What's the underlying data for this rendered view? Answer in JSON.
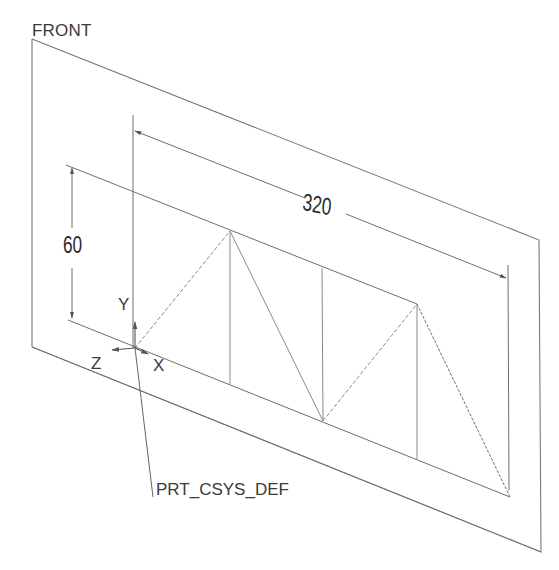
{
  "view": {
    "plane_label": "FRONT",
    "csys_label": "PRT_CSYS_DEF",
    "axes": {
      "x": "X",
      "y": "Y",
      "z": "Z"
    },
    "dimensions": {
      "length": "320",
      "height": "60"
    }
  },
  "colors": {
    "background": "#ffffff",
    "line": "#6e6e6e",
    "dashed": "#8a8a8a",
    "text": "#3a3a3a"
  },
  "geometry": {
    "plane": [
      [
        32,
        39
      ],
      [
        539,
        240
      ],
      [
        541,
        552
      ],
      [
        32,
        347
      ]
    ],
    "origin": [
      135,
      348
    ],
    "truss_top_nodes": [
      [
        230,
        231
      ],
      [
        322,
        268
      ],
      [
        417,
        304
      ]
    ],
    "truss_bottom_nodes": [
      [
        135,
        348
      ],
      [
        230,
        384
      ],
      [
        323,
        421
      ],
      [
        417,
        459
      ],
      [
        510,
        497
      ]
    ]
  }
}
